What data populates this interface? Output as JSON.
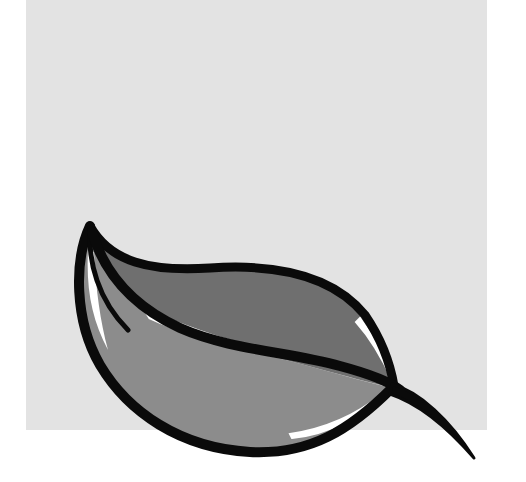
{
  "image": {
    "description": "Leaf logo illustration on a light gray square",
    "alt_text": "Stylized two-tone gray leaf with black outline"
  },
  "colors": {
    "page_background": "#ffffff",
    "square_background": "#e3e3e3",
    "leaf_upper_fill": "#6f6f6f",
    "leaf_lower_fill": "#8c8c8c",
    "outline": "#0a0a0a",
    "highlight": "#ffffff"
  }
}
